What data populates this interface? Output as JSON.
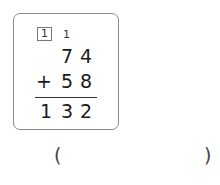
{
  "problem": {
    "carry_boxed": "1",
    "carry_plain": "1",
    "addend1": [
      "7",
      "4"
    ],
    "operator": "+",
    "addend2": [
      "5",
      "8"
    ],
    "sum": [
      "1",
      "3",
      "2"
    ]
  },
  "answer": {
    "open_paren": "(",
    "close_paren": ")",
    "value": ""
  }
}
